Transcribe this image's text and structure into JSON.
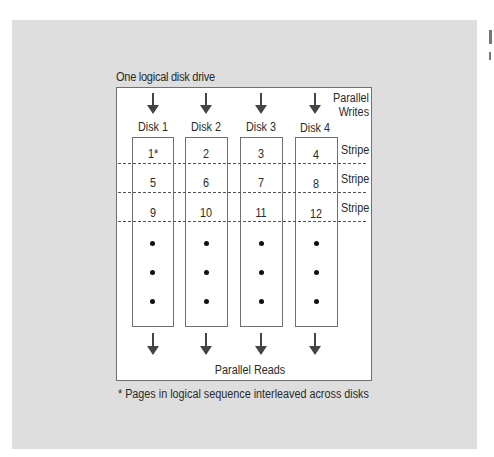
{
  "diagram": {
    "title": "One logical disk drive",
    "top_label_line1": "Parallel",
    "top_label_line2": "Writes",
    "bottom_label": "Parallel Reads",
    "footnote": "* Pages in logical sequence interleaved across disks",
    "disks": [
      {
        "label": "Disk 1",
        "pages": [
          "1*",
          "5",
          "9"
        ]
      },
      {
        "label": "Disk 2",
        "pages": [
          "2",
          "6",
          "10"
        ]
      },
      {
        "label": "Disk 3",
        "pages": [
          "3",
          "7",
          "11"
        ]
      },
      {
        "label": "Disk 4",
        "pages": [
          "4",
          "8",
          "12"
        ]
      }
    ],
    "stripes": [
      "Stripe",
      "Stripe",
      "Stripe"
    ],
    "continuation": "•",
    "colors": {
      "panel": "#dedede",
      "box": "#ffffff",
      "line": "#6f6f6f",
      "text": "#2a2a2a"
    }
  }
}
